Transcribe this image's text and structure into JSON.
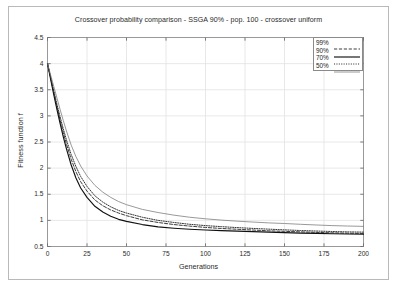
{
  "chart_data": {
    "type": "line",
    "title": "Crossover probability comparison - SSGA 90% - pop. 100 - crossover uniform",
    "xlabel": "Generations",
    "ylabel": "Fitness function f",
    "xlim": [
      0,
      200
    ],
    "ylim": [
      0.5,
      4.5
    ],
    "xticks": [
      "0",
      "25",
      "50",
      "75",
      "100",
      "125",
      "150",
      "175",
      "200"
    ],
    "xtick_values": [
      0,
      25,
      50,
      75,
      100,
      125,
      150,
      175,
      200
    ],
    "yticks": [
      "0.5",
      "1",
      "1.5",
      "2",
      "2.5",
      "3",
      "3.5",
      "4",
      "4.5"
    ],
    "ytick_values": [
      0.5,
      1,
      1.5,
      2,
      2.5,
      3,
      3.5,
      4,
      4.5
    ],
    "grid": true,
    "legend_position": "top-right",
    "x": [
      0,
      2,
      4,
      6,
      8,
      10,
      12,
      15,
      18,
      21,
      25,
      30,
      35,
      40,
      45,
      50,
      60,
      70,
      80,
      90,
      100,
      110,
      120,
      130,
      140,
      150,
      160,
      170,
      180,
      190,
      200
    ],
    "series": [
      {
        "name": "99%",
        "style": "dashed",
        "color": "#333333",
        "values": [
          4.0,
          3.72,
          3.44,
          3.17,
          2.92,
          2.68,
          2.46,
          2.17,
          1.93,
          1.74,
          1.56,
          1.39,
          1.28,
          1.2,
          1.14,
          1.09,
          1.01,
          0.96,
          0.92,
          0.89,
          0.865,
          0.845,
          0.83,
          0.815,
          0.8,
          0.79,
          0.78,
          0.77,
          0.762,
          0.755,
          0.75
        ]
      },
      {
        "name": "90%",
        "style": "solid",
        "color": "#111111",
        "values": [
          4.0,
          3.7,
          3.4,
          3.12,
          2.85,
          2.6,
          2.37,
          2.06,
          1.81,
          1.62,
          1.44,
          1.27,
          1.16,
          1.08,
          1.02,
          0.98,
          0.92,
          0.875,
          0.85,
          0.83,
          0.815,
          0.805,
          0.795,
          0.785,
          0.775,
          0.765,
          0.757,
          0.75,
          0.745,
          0.74,
          0.735
        ]
      },
      {
        "name": "70%",
        "style": "dotted",
        "color": "#2b2b2b",
        "values": [
          4.0,
          3.74,
          3.48,
          3.22,
          2.98,
          2.75,
          2.54,
          2.26,
          2.03,
          1.84,
          1.65,
          1.47,
          1.35,
          1.26,
          1.19,
          1.14,
          1.06,
          1.0,
          0.96,
          0.925,
          0.9,
          0.88,
          0.862,
          0.846,
          0.832,
          0.818,
          0.806,
          0.796,
          0.787,
          0.78,
          0.775
        ]
      },
      {
        "name": "50%",
        "style": "thin-light",
        "color": "#777777",
        "values": [
          4.0,
          3.78,
          3.56,
          3.34,
          3.12,
          2.91,
          2.71,
          2.44,
          2.22,
          2.04,
          1.85,
          1.67,
          1.54,
          1.44,
          1.36,
          1.3,
          1.21,
          1.15,
          1.1,
          1.06,
          1.03,
          1.005,
          0.985,
          0.968,
          0.952,
          0.94,
          0.925,
          0.912,
          0.9,
          0.892,
          0.885
        ]
      }
    ]
  }
}
